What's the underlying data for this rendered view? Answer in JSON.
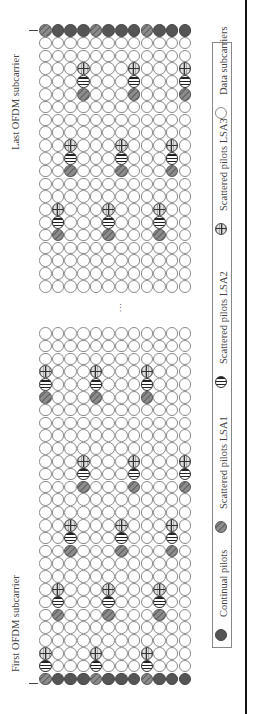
{
  "labels": {
    "first_subcarrier": "First OFDM subcarrier",
    "last_subcarrier": "Last OFDM subcarrier",
    "ellipsis": "..."
  },
  "legend": [
    {
      "type": "continual",
      "label": "Continual pilots"
    },
    {
      "type": "lsa1",
      "label": "Scattered pilots LSA1"
    },
    {
      "type": "lsa2",
      "label": "Scattered pilots LSA2"
    },
    {
      "type": "lsa3",
      "label": "Scattered pilots LSA3"
    },
    {
      "type": "data",
      "label": "Data subcarriers"
    }
  ],
  "grid": {
    "columns": 12,
    "colors": {
      "continual": "#555555",
      "lsa1": "#7a7a7a",
      "lsa2": "#222222",
      "lsa3": "#333333",
      "data": "#ffffff"
    },
    "upper_block": {
      "rows": 21,
      "continual_row": 0,
      "lsa1_in_continual_cols": [
        0,
        4,
        8
      ],
      "groups": [
        {
          "cols": [
            3,
            7,
            11
          ],
          "lsa3_row": 3,
          "lsa2_row": 4,
          "lsa1_row": 5
        },
        {
          "cols": [
            2,
            6,
            10
          ],
          "lsa3_row": 9,
          "lsa2_row": 10,
          "lsa1_row": 11
        },
        {
          "cols": [
            1,
            5,
            9
          ],
          "lsa3_row": 14,
          "lsa2_row": 15,
          "lsa1_row": 16
        }
      ]
    },
    "lower_block": {
      "rows": 28,
      "continual_row": 27,
      "lsa1_in_continual_cols": [
        0,
        4,
        8
      ],
      "groups": [
        {
          "cols": [
            0,
            4,
            8
          ],
          "lsa3_row": 3,
          "lsa2_row": 4,
          "lsa1_row": 5
        },
        {
          "cols": [
            3,
            7,
            11
          ],
          "lsa3_row": 10,
          "lsa2_row": 11,
          "lsa1_row": 12
        },
        {
          "cols": [
            2,
            6,
            10
          ],
          "lsa3_row": 15,
          "lsa2_row": 16,
          "lsa1_row": 17
        },
        {
          "cols": [
            1,
            5,
            9
          ],
          "lsa3_row": 20,
          "lsa2_row": 21,
          "lsa1_row": 22
        },
        {
          "cols": [
            0,
            4,
            8
          ],
          "lsa3_row": 25,
          "lsa2_row": 26,
          "lsa1_row": 27
        }
      ]
    }
  }
}
